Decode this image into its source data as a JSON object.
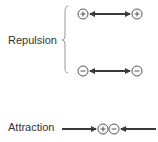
{
  "diagram": {
    "repulsion": {
      "label": "Repulsion",
      "pairs": [
        {
          "left": "+",
          "right": "+",
          "arrow": "double-headed"
        },
        {
          "left": "−",
          "right": "−",
          "arrow": "double-headed"
        }
      ]
    },
    "attraction": {
      "label": "Attraction",
      "charges": [
        "+",
        "−"
      ],
      "arrows": "inward"
    },
    "colors": {
      "arrow": "#3a3a3a",
      "text": "#333333",
      "brace": "#999999"
    }
  }
}
